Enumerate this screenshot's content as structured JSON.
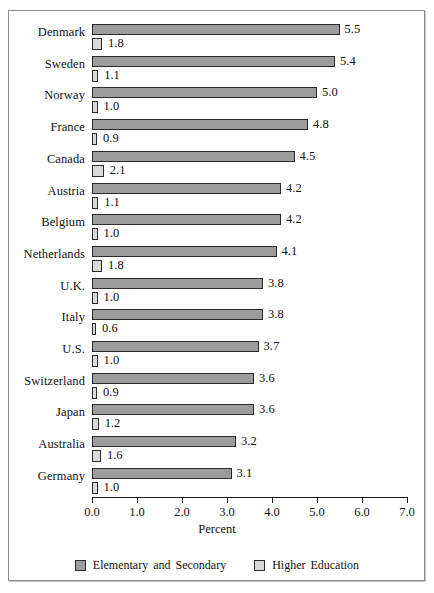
{
  "chart_data": {
    "type": "bar",
    "orientation": "horizontal",
    "title": "",
    "xlabel": "Percent",
    "ylabel": "",
    "xlim": [
      0.0,
      7.0
    ],
    "xticks": [
      "0.0",
      "1.0",
      "2.0",
      "3.0",
      "4.0",
      "5.0",
      "6.0",
      "7.0"
    ],
    "grid": false,
    "legend_position": "bottom",
    "categories": [
      "Denmark",
      "Sweden",
      "Norway",
      "France",
      "Canada",
      "Austria",
      "Belgium",
      "Netherlands",
      "U.K.",
      "Italy",
      "U.S.",
      "Switzerland",
      "Japan",
      "Australia",
      "Germany"
    ],
    "series": [
      {
        "name": "Elementary and Secondary",
        "color": "#9c9c9c",
        "values": [
          5.5,
          5.4,
          5.0,
          4.8,
          4.5,
          4.2,
          4.2,
          4.1,
          3.8,
          3.8,
          3.7,
          3.6,
          3.6,
          3.2,
          3.1
        ],
        "labels": [
          "5.5",
          "5.4",
          "5.0",
          "4.8",
          "4.5",
          "4.2",
          "4.2",
          "4.1",
          "3.8",
          "3.8",
          "3.7",
          "3.6",
          "3.6",
          "3.2",
          "3.1"
        ]
      },
      {
        "name": "Higher Education",
        "color": "#d9d9d9",
        "values": [
          1.8,
          1.1,
          1.0,
          0.9,
          2.1,
          1.1,
          1.0,
          1.8,
          1.0,
          0.6,
          1.0,
          0.9,
          1.2,
          1.6,
          1.0
        ],
        "labels": [
          "1.8",
          "1.1",
          "1.0",
          "0.9",
          "2.1",
          "1.1",
          "1.0",
          "1.8",
          "1.0",
          "0.6",
          "1.0",
          "0.9",
          "1.2",
          "1.6",
          "1.0"
        ]
      }
    ]
  },
  "legend": {
    "items": [
      {
        "label": "Elementary and Secondary"
      },
      {
        "label": "Higher Education"
      }
    ]
  },
  "axis": {
    "title": "Percent"
  }
}
